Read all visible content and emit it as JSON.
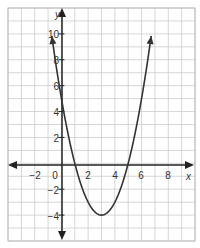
{
  "chart_data": {
    "type": "line",
    "title": "",
    "xlabel": "x",
    "ylabel": "y",
    "xlim": [
      -4,
      10
    ],
    "ylim": [
      -6,
      12
    ],
    "grid": true,
    "grid_step": 1,
    "x_ticks": [
      {
        "value": -2,
        "label": "−2"
      },
      {
        "value": 0,
        "label": "0"
      },
      {
        "value": 2,
        "label": "2"
      },
      {
        "value": 4,
        "label": "4"
      },
      {
        "value": 6,
        "label": "6"
      },
      {
        "value": 8,
        "label": "8"
      }
    ],
    "y_ticks": [
      {
        "value": 10,
        "label": "10"
      },
      {
        "value": 8,
        "label": "8"
      },
      {
        "value": 6,
        "label": "6"
      },
      {
        "value": 4,
        "label": "4"
      },
      {
        "value": 2,
        "label": "2"
      },
      {
        "value": -2,
        "label": "−2"
      },
      {
        "value": -4,
        "label": "−4"
      }
    ],
    "series": [
      {
        "name": "y = x² − 6x + 5",
        "equation": "y = (x - 1)(x - 5)",
        "vertex": [
          3,
          -4
        ],
        "roots": [
          1,
          5
        ],
        "y_intercept": 5,
        "x": [
          -0.7,
          0,
          1,
          2,
          3,
          4,
          5,
          6,
          6.7
        ],
        "values": [
          9.69,
          5,
          0,
          -3,
          -4,
          -3,
          0,
          5,
          9.69
        ]
      }
    ],
    "colors": {
      "curve": "#333333",
      "axes": "#222222",
      "grid": "#cccccc",
      "border": "#bbbbbb"
    }
  }
}
